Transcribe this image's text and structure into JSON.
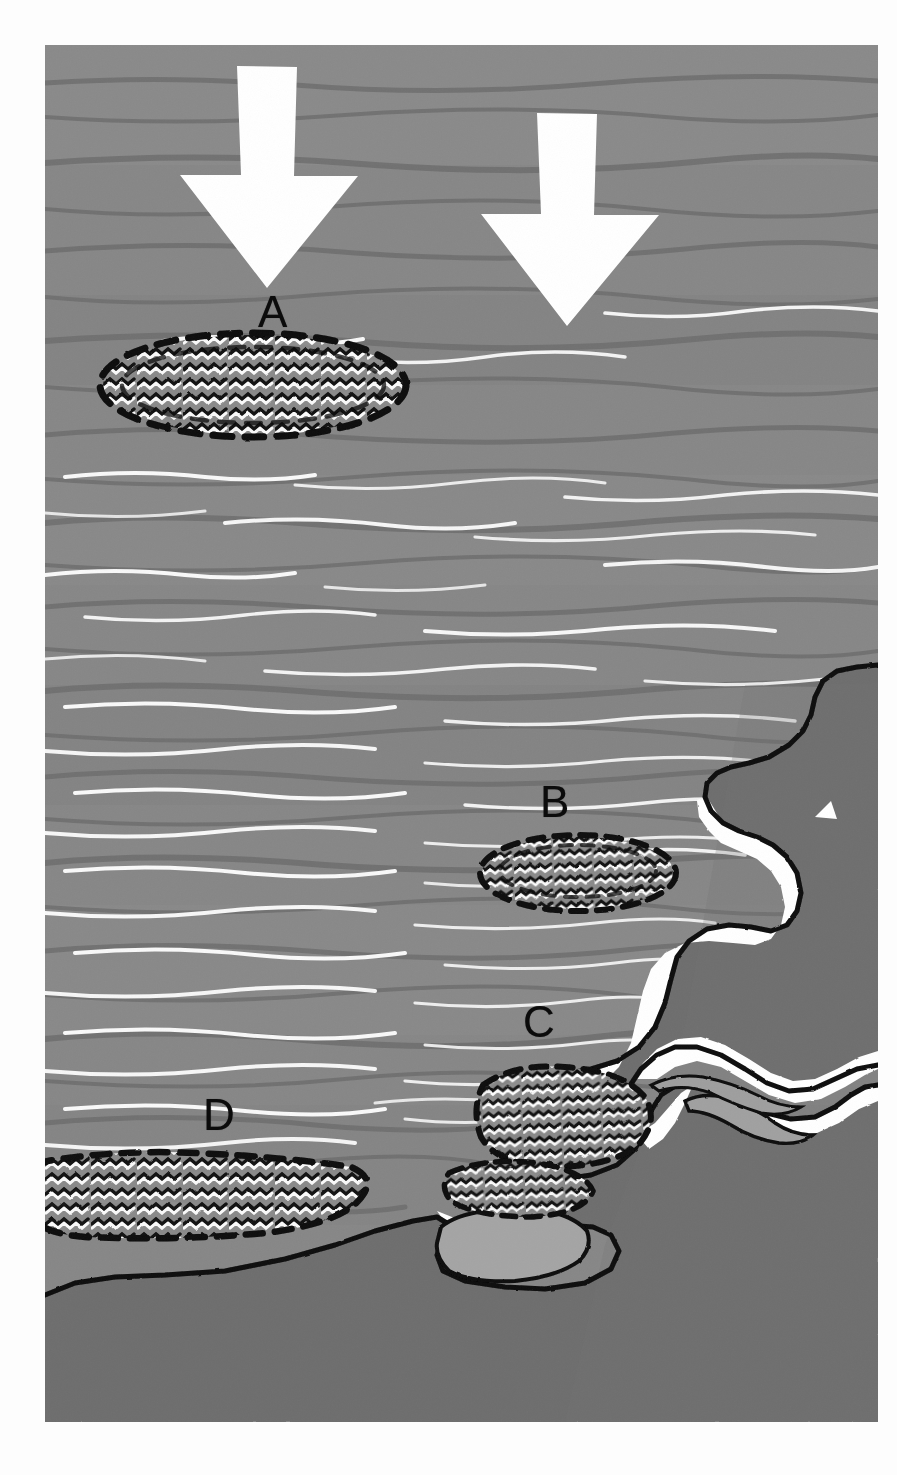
{
  "figure": {
    "domain": "scientific-illustration",
    "orientation": "arrows point downward toward the shore",
    "style": "grayscale ink and wash drawing"
  },
  "canvas": {
    "width": 897,
    "height": 1475,
    "plate_left": 45,
    "plate_top": 45,
    "plate_width": 833,
    "plate_height": 1377
  },
  "colors": {
    "background": "#fdfdfd",
    "ocean_base": "#878787",
    "ocean_shadow": "#6f6f6f",
    "ocean_highlight": "#ffffff",
    "land": "#6e6e6e",
    "surf_white": "#ffffff",
    "lagoon_fill": "#9a9a9a",
    "outline": "#0b0b0b",
    "arrow_fill": "#ffffff",
    "label_color": "#0b0b0b"
  },
  "labels": [
    {
      "id": "A",
      "text": "A",
      "meaning": "offshore patch in open water, fully surrounded by water"
    },
    {
      "id": "B",
      "text": "B",
      "meaning": "patch advected closer to shore, adjacent to the headland"
    },
    {
      "id": "C",
      "text": "C",
      "meaning": "patch in the shallow nearshore, touching the shoreline"
    },
    {
      "id": "D",
      "text": "D",
      "meaning": "patch stranded along the swash zone of the beach"
    }
  ],
  "patches": [
    {
      "id": "A",
      "shape": "ellipse",
      "center_x": 208,
      "center_y": 340,
      "radius_x": 153,
      "radius_y": 52,
      "outline": "dashed",
      "fill_texture": "zigzag-hatch",
      "position": "offshore"
    },
    {
      "id": "B",
      "shape": "ellipse",
      "center_x": 533,
      "center_y": 828,
      "radius_x": 98,
      "radius_y": 38,
      "outline": "dashed",
      "fill_texture": "zigzag-hatch",
      "position": "nearshore"
    },
    {
      "id": "C",
      "shape": "lobed",
      "center_x": 530,
      "center_y": 1085,
      "radius_x": 92,
      "radius_y": 55,
      "outline": "dashed",
      "fill_texture": "zigzag-hatch",
      "position": "shoreline-contact"
    },
    {
      "id": "D",
      "shape": "band",
      "center_x": 145,
      "center_y": 1150,
      "radius_x": 165,
      "radius_y": 42,
      "outline": "dashed",
      "fill_texture": "zigzag-hatch",
      "position": "beach-stranded"
    }
  ],
  "arrows": [
    {
      "id": "arrow-left",
      "direction": "down",
      "tip_x": 222,
      "tip_y": 243,
      "shaft_width": 60,
      "head_width": 126,
      "top_y": 21
    },
    {
      "id": "arrow-right",
      "direction": "down",
      "tip_x": 522,
      "tip_y": 281,
      "shaft_width": 60,
      "head_width": 126,
      "top_y": 68
    }
  ],
  "features": {
    "coastline": "irregular headland and embayment occupying the right and lower portion of the plate, drawn with a heavy black ink outline and a white surf/beach band",
    "surf_band": "white band following the shoreline representing breaking surf and dry beach",
    "lagoons": "two pale enclosed pools inland of the shoreline within the lower land mass",
    "notch": "small white triangular notch in the upper coastline",
    "wave_texture": "horizontal wavy strokes with white crests representing swell and whitecaps"
  }
}
